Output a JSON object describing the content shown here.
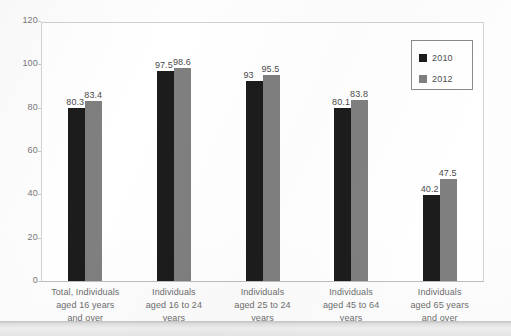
{
  "chart_data": {
    "type": "bar",
    "title": "",
    "subtitle": "",
    "xlabel": "",
    "ylabel": "",
    "ylim": [
      0,
      120
    ],
    "yticks": [
      0,
      20,
      40,
      60,
      80,
      100,
      120
    ],
    "ytick_labels": [
      "0",
      "20",
      "40",
      "60",
      "80",
      "100",
      "120"
    ],
    "grid": false,
    "legend_position": "upper-right",
    "categories": [
      "Total, Individuals aged 16 years and over",
      "Individuals aged 16 to 24 years",
      "Individuals aged 25 to 24 years",
      "Individuals aged 45 to 64 years",
      "Individuals aged 65 years and over"
    ],
    "category_lines": [
      [
        "Total, Individuals",
        "aged 16 years",
        "and over"
      ],
      [
        "Individuals",
        "aged 16 to 24",
        "years"
      ],
      [
        "Individuals",
        "aged 25 to 24",
        "years"
      ],
      [
        "Individuals",
        "aged 45 to 64",
        "years"
      ],
      [
        "Individuals",
        "aged 65 years",
        "and over"
      ]
    ],
    "series": [
      {
        "name": "2010",
        "color": "#1c1c1c",
        "values": [
          80.3,
          97.5,
          93,
          80.1,
          40.2
        ],
        "labels": [
          "80.3",
          "97.5",
          "93",
          "80.1",
          "40.2"
        ]
      },
      {
        "name": "2012",
        "color": "#7f7f7f",
        "values": [
          83.4,
          98.6,
          95.5,
          83.8,
          47.5
        ],
        "labels": [
          "83.4",
          "98.6",
          "95.5",
          "83.8",
          "47.5"
        ]
      }
    ]
  },
  "legend": {
    "entries": [
      {
        "label": "2010",
        "color": "#1c1c1c"
      },
      {
        "label": "2012",
        "color": "#7f7f7f"
      }
    ]
  }
}
